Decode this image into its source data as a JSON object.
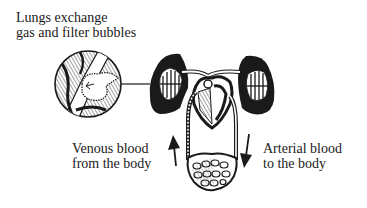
{
  "diagram": {
    "type": "anatomical-circulation",
    "labels": {
      "lungs": [
        "Lungs exchange",
        "gas and filter bubbles"
      ],
      "venous": [
        "Venous blood",
        "from the body"
      ],
      "arterial": [
        "Arterial blood",
        "to the body"
      ]
    },
    "arrows": {
      "venous_direction": "up",
      "arterial_direction": "down"
    },
    "colors": {
      "ink": "#1a1a1a",
      "background": "#ffffff"
    }
  }
}
